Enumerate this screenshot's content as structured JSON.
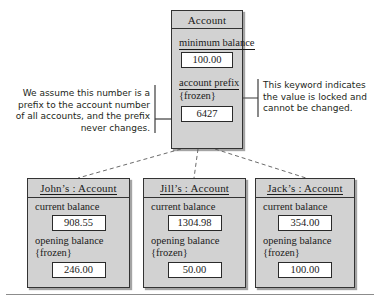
{
  "diagram": {
    "class_box": {
      "title": "Account",
      "attributes": [
        {
          "name": "minimum balance",
          "underlined": true,
          "tag": "",
          "value": "100.00"
        },
        {
          "name": "account prefix",
          "underlined": true,
          "tag": "{frozen}",
          "value": "6427"
        }
      ]
    },
    "instances": [
      {
        "title": "John’s : Account",
        "attributes": [
          {
            "name": "current balance",
            "tag": "",
            "value": "908.55"
          },
          {
            "name": "opening balance",
            "tag": "{frozen}",
            "value": "246.00"
          }
        ]
      },
      {
        "title": "Jill’s : Account",
        "attributes": [
          {
            "name": "current balance",
            "tag": "",
            "value": "1304.98"
          },
          {
            "name": "opening balance",
            "tag": "{frozen}",
            "value": "50.00"
          }
        ]
      },
      {
        "title": "Jack’s : Account",
        "attributes": [
          {
            "name": "current balance",
            "tag": "",
            "value": "354.00"
          },
          {
            "name": "opening balance",
            "tag": "{frozen}",
            "value": "100.00"
          }
        ]
      }
    ],
    "notes": {
      "left": "We assume this number is a prefix to the account number of all accounts, and the prefix never changes.",
      "right": "This keyword indicates the value is locked and cannot be changed."
    },
    "colors": {
      "box_fill": "#d2d2d2",
      "box_border": "#333333",
      "value_fill": "#ffffff",
      "connector": "#3b3b3b",
      "text": "#1a1a1a"
    }
  }
}
